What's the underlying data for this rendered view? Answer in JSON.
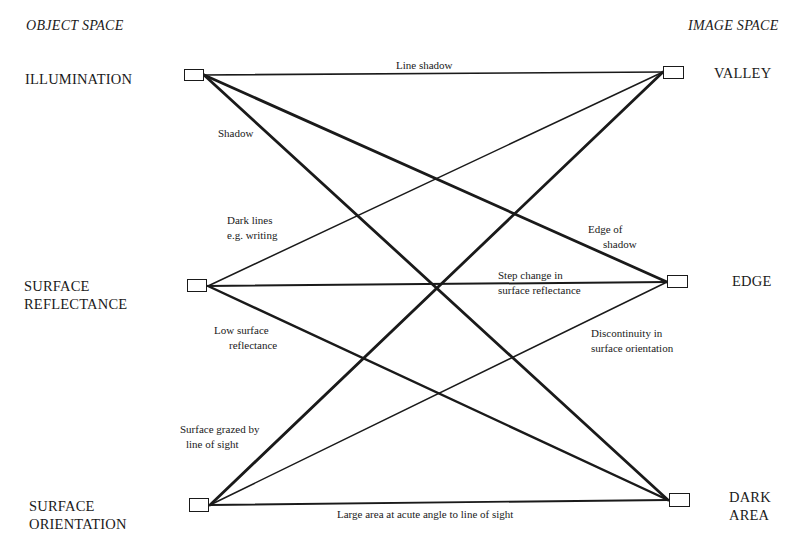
{
  "headings": {
    "left": "OBJECT SPACE",
    "right": "IMAGE SPACE"
  },
  "object_space": [
    {
      "id": "illumination",
      "line1": "ILLUMINATION",
      "line2": ""
    },
    {
      "id": "surface_reflectance",
      "line1": "SURFACE",
      "line2": "REFLECTANCE"
    },
    {
      "id": "surface_orientation",
      "line1": "SURFACE",
      "line2": "ORIENTATION"
    }
  ],
  "image_space": [
    {
      "id": "valley",
      "line1": "VALLEY",
      "line2": ""
    },
    {
      "id": "edge",
      "line1": "EDGE",
      "line2": ""
    },
    {
      "id": "dark_area",
      "line1": "DARK",
      "line2": "AREA"
    }
  ],
  "connections": [
    {
      "from": "illumination",
      "to": "valley",
      "label1": "Line shadow",
      "label2": ""
    },
    {
      "from": "illumination",
      "to": "edge",
      "label1": "Edge of",
      "label2": "shadow"
    },
    {
      "from": "illumination",
      "to": "dark_area",
      "label1": "Shadow",
      "label2": ""
    },
    {
      "from": "surface_reflectance",
      "to": "valley",
      "label1": "Dark lines",
      "label2": "e.g. writing"
    },
    {
      "from": "surface_reflectance",
      "to": "edge",
      "label1": "Step change in",
      "label2": "surface reflectance"
    },
    {
      "from": "surface_reflectance",
      "to": "dark_area",
      "label1": "Low surface",
      "label2": "reflectance"
    },
    {
      "from": "surface_orientation",
      "to": "valley",
      "label1": "Surface grazed by",
      "label2": "line of sight"
    },
    {
      "from": "surface_orientation",
      "to": "edge",
      "label1": "Discontinuity in",
      "label2": "surface orientation"
    },
    {
      "from": "surface_orientation",
      "to": "dark_area",
      "label1": "Large area at acute angle to line of sight",
      "label2": ""
    }
  ]
}
